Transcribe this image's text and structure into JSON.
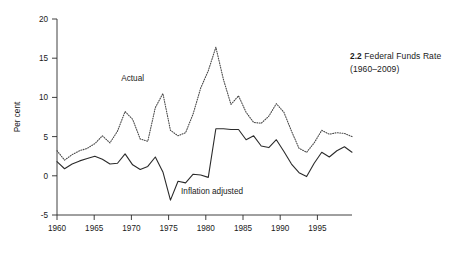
{
  "caption": {
    "number": "2.2",
    "title": "Federal Funds Rate",
    "years": "(1960–2009)"
  },
  "chart_data": {
    "type": "line",
    "title": "Federal Funds Rate",
    "subtitle": "(1960–2009)",
    "xlabel": "",
    "ylabel": "Per cent",
    "xlim": [
      1960,
      1999
    ],
    "ylim": [
      -5,
      20
    ],
    "xticks": [
      1960,
      1965,
      1970,
      1975,
      1980,
      1985,
      1990,
      1995
    ],
    "yticks": [
      -5,
      0,
      5,
      10,
      15,
      20
    ],
    "grid": false,
    "legend": "inline-annotations",
    "annotations": [
      {
        "text": "Actual",
        "x": 1970,
        "y": 12.1
      },
      {
        "text": "Inflation adjusted",
        "x": 1980.5,
        "y": -2.3
      }
    ],
    "x": [
      1960,
      1961,
      1962,
      1963,
      1964,
      1965,
      1966,
      1967,
      1968,
      1969,
      1970,
      1971,
      1972,
      1973,
      1974,
      1975,
      1976,
      1977,
      1978,
      1979,
      1980,
      1981,
      1982,
      1983,
      1984,
      1985,
      1986,
      1987,
      1988,
      1989,
      1990,
      1991,
      1992,
      1993,
      1994,
      1995,
      1996,
      1997,
      1998,
      1999
    ],
    "series": [
      {
        "name": "Actual",
        "style": "dotted",
        "values": [
          3.2,
          2.0,
          2.7,
          3.2,
          3.5,
          4.1,
          5.1,
          4.2,
          5.7,
          8.2,
          7.2,
          4.7,
          4.4,
          8.7,
          10.5,
          5.8,
          5.1,
          5.5,
          7.9,
          11.2,
          13.4,
          16.4,
          12.3,
          9.1,
          10.2,
          8.1,
          6.8,
          6.7,
          7.6,
          9.2,
          8.1,
          5.7,
          3.5,
          3.0,
          4.2,
          5.8,
          5.3,
          5.5,
          5.4,
          5.0
        ]
      },
      {
        "name": "Inflation adjusted",
        "style": "solid",
        "values": [
          1.8,
          0.9,
          1.5,
          1.9,
          2.2,
          2.5,
          2.1,
          1.5,
          1.6,
          2.8,
          1.4,
          0.8,
          1.2,
          2.4,
          0.5,
          -3.1,
          -0.7,
          -0.9,
          0.2,
          0.1,
          -0.2,
          6.0,
          6.0,
          5.9,
          5.9,
          4.6,
          5.1,
          3.8,
          3.6,
          4.6,
          3.1,
          1.5,
          0.4,
          -0.1,
          1.6,
          3.0,
          2.4,
          3.2,
          3.7,
          3.0
        ]
      }
    ]
  },
  "axis": {
    "y_label": "Per cent"
  }
}
